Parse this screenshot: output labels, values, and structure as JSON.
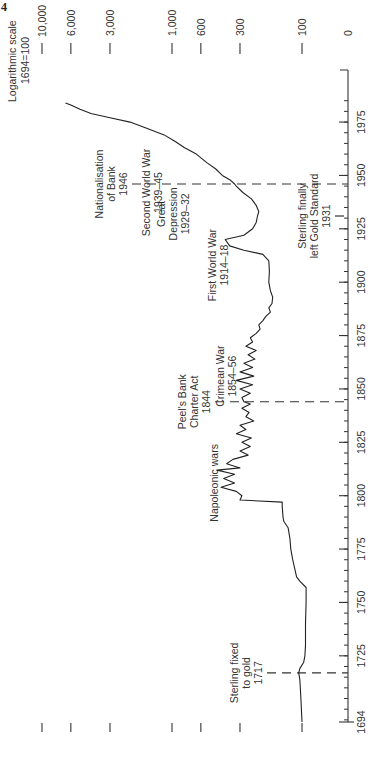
{
  "page_marker": "4",
  "chart_data": {
    "type": "line",
    "orientation": "rotated-90-ccw",
    "title": "",
    "scale_note_line1": "Logarithmic scale",
    "scale_note_line2": "1694=100",
    "xlabel": "",
    "ylabel": "",
    "y_scale": "log",
    "xlim": [
      1694,
      1985
    ],
    "ylim": [
      50,
      10000
    ],
    "x_ticks_major": [
      1694,
      1725,
      1750,
      1775,
      1800,
      1825,
      1850,
      1875,
      1900,
      1925,
      1950,
      1975
    ],
    "x_tick_labels": [
      "1694",
      "1725",
      "1750",
      "1775",
      "1800",
      "1825",
      "1850",
      "1875",
      "1900",
      "1925",
      "1950",
      "1975"
    ],
    "x_minor_tick_step": 5,
    "y_ticks": [
      0,
      100,
      300,
      600,
      1000,
      3000,
      6000,
      10000
    ],
    "y_tick_labels": [
      "0",
      "100",
      "300",
      "600",
      "1,000",
      "3,000",
      "6,000",
      "10,000"
    ],
    "grid": false,
    "legend": null,
    "series": [
      {
        "name": "Price index (1694=100)",
        "x": [
          1694,
          1700,
          1705,
          1710,
          1714,
          1717,
          1719,
          1722,
          1725,
          1730,
          1740,
          1750,
          1757,
          1760,
          1762,
          1770,
          1775,
          1780,
          1785,
          1788,
          1790,
          1795,
          1797,
          1798,
          1800,
          1802,
          1804,
          1806,
          1808,
          1810,
          1812,
          1813,
          1815,
          1817,
          1819,
          1821,
          1823,
          1825,
          1827,
          1829,
          1831,
          1833,
          1835,
          1837,
          1839,
          1841,
          1843,
          1844,
          1846,
          1848,
          1850,
          1852,
          1854,
          1856,
          1858,
          1860,
          1862,
          1864,
          1866,
          1868,
          1870,
          1872,
          1874,
          1876,
          1878,
          1880,
          1882,
          1884,
          1886,
          1888,
          1890,
          1893,
          1896,
          1900,
          1905,
          1910,
          1913,
          1915,
          1917,
          1920,
          1922,
          1925,
          1928,
          1931,
          1933,
          1936,
          1939,
          1942,
          1945,
          1946,
          1948,
          1950,
          1953,
          1956,
          1960,
          1963,
          1966,
          1969,
          1972,
          1975,
          1977,
          1979,
          1981,
          1983,
          1984
        ],
        "values": [
          100,
          101,
          102,
          103,
          104,
          106,
          104,
          97,
          95,
          94,
          94,
          93,
          93,
          104,
          110,
          118,
          122,
          124,
          128,
          138,
          140,
          142,
          142,
          300,
          290,
          320,
          420,
          330,
          400,
          330,
          450,
          300,
          380,
          340,
          260,
          300,
          250,
          290,
          245,
          320,
          270,
          300,
          235,
          270,
          255,
          290,
          250,
          280,
          290,
          250,
          300,
          240,
          320,
          235,
          300,
          240,
          280,
          230,
          260,
          225,
          270,
          240,
          250,
          225,
          210,
          215,
          200,
          190,
          175,
          180,
          170,
          168,
          175,
          180,
          178,
          180,
          200,
          280,
          360,
          390,
          280,
          240,
          225,
          220,
          215,
          225,
          245,
          285,
          320,
          330,
          360,
          410,
          460,
          540,
          650,
          800,
          950,
          1150,
          1550,
          2100,
          3000,
          4200,
          5100,
          6000,
          6600
        ]
      }
    ],
    "annotations": [
      {
        "label_lines": [
          "Sterling fixed",
          "to gold",
          "1717"
        ],
        "year": 1717,
        "dashed_line": true
      },
      {
        "label_lines": [
          "Napoleonic wars"
        ],
        "year": 1806,
        "dashed_line": false
      },
      {
        "label_lines": [
          "Peel's Bank",
          "Charter Act",
          "1844"
        ],
        "year": 1844,
        "dashed_line": true
      },
      {
        "label_lines": [
          "Crimean War",
          "1854–56"
        ],
        "year": 1856,
        "dashed_line": false
      },
      {
        "label_lines": [
          "First World War",
          "1914–18"
        ],
        "year": 1908,
        "dashed_line": false
      },
      {
        "label_lines": [
          "Sterling finally",
          "left Gold Standard",
          "1931"
        ],
        "year": 1931,
        "dashed_line": true
      },
      {
        "label_lines": [
          "Great",
          "Depression",
          "1929–32"
        ],
        "year": 1932,
        "dashed_line": false
      },
      {
        "label_lines": [
          "Second World War",
          "1939–45"
        ],
        "year": 1942,
        "dashed_line": false
      },
      {
        "label_lines": [
          "Nationalisation",
          "of Bank",
          "1946"
        ],
        "year": 1946,
        "dashed_line": true
      }
    ]
  }
}
